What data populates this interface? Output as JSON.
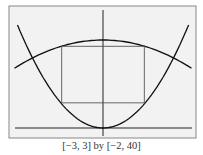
{
  "chart_data": {
    "type": "line",
    "title": "",
    "window_caption": "[−3, 3] by [−2, 40]",
    "xlim": [
      -3,
      3
    ],
    "ylim": [
      -2,
      40
    ],
    "grid": false,
    "series": [
      {
        "name": "upward parabola",
        "description": "parabola with vertex at origin, opening upward",
        "x": [
          -3,
          -2.5,
          -2,
          -1.5,
          -1,
          -0.5,
          0,
          0.5,
          1,
          1.5,
          2,
          2.5,
          3
        ],
        "y": [
          33,
          22.9,
          14.7,
          8.3,
          3.7,
          0.9,
          0,
          0.9,
          3.7,
          8.3,
          14.7,
          22.9,
          33
        ]
      },
      {
        "name": "downward parabola",
        "description": "parabola opening downward, vertex at (0, ~28)",
        "x": [
          -3,
          -2,
          -1,
          0,
          1,
          2,
          3
        ],
        "y": [
          19,
          24,
          27,
          28,
          27,
          24,
          19
        ]
      }
    ],
    "annotations": [
      {
        "type": "rectangle",
        "description": "inscribed rectangle between curves",
        "x_range": [
          -1.4,
          1.4
        ],
        "y_range": [
          8,
          26
        ]
      }
    ],
    "colors": {
      "frame_bg": "#f2f2f2",
      "frame_border": "#888888",
      "curve": "#111111",
      "rectangle": "#555555"
    }
  },
  "caption": "[−3, 3] by [−2, 40]"
}
